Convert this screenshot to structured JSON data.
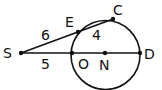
{
  "diagram": {
    "type": "geometry-secants",
    "circle": {
      "center": "N",
      "cx": 105.5,
      "cy": 55,
      "r": 34.5
    },
    "points": [
      {
        "id": "S",
        "label": "S",
        "x": 21,
        "y": 53,
        "lx": 3,
        "ly": 58
      },
      {
        "id": "E",
        "label": "E",
        "x": 78,
        "y": 32,
        "lx": 65,
        "ly": 27
      },
      {
        "id": "C",
        "label": "C",
        "x": 113,
        "y": 19,
        "lx": 113,
        "ly": 15
      },
      {
        "id": "O",
        "label": "O",
        "x": 72,
        "y": 53,
        "lx": 78,
        "ly": 69
      },
      {
        "id": "N",
        "label": "N",
        "x": 105,
        "y": 53,
        "lx": 99,
        "ly": 70
      },
      {
        "id": "D",
        "label": "D",
        "x": 140,
        "y": 53,
        "lx": 144,
        "ly": 59
      }
    ],
    "segments": [
      {
        "from": "S",
        "to": "C"
      },
      {
        "from": "S",
        "to": "D"
      }
    ],
    "lengths": [
      {
        "segment": "SE",
        "value": "6",
        "x": 41,
        "y": 40
      },
      {
        "segment": "EC",
        "value": "4",
        "x": 92,
        "y": 40
      },
      {
        "segment": "SO",
        "value": "5",
        "x": 41,
        "y": 69
      }
    ]
  }
}
